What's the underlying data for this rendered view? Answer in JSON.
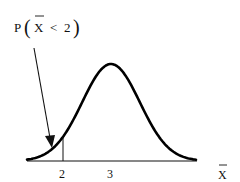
{
  "chart_data": {
    "type": "line",
    "title": "",
    "annotation": {
      "prefix": "P",
      "variable": "X",
      "variable_has_bar": true,
      "relation": "<",
      "value": "2",
      "full_text": "P(X̄ < 2)",
      "points_to": "left tail area below 2"
    },
    "distribution": "normal",
    "mean": 3,
    "sd": 0.6,
    "xlabel": "X̄",
    "xlabel_text": "X",
    "xlabel_has_bar": true,
    "ylabel": "",
    "x_ticks": [
      {
        "value": 2,
        "label": "2"
      },
      {
        "value": 3,
        "label": "3"
      }
    ],
    "marker_line_at": 2,
    "grid": false,
    "legend": null,
    "colors": {
      "curve": "#000000",
      "axis": "#111111",
      "text": "#111111"
    }
  }
}
